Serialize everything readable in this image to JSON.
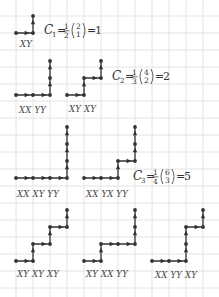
{
  "figure": {
    "grid": {
      "cell": 17,
      "origin_x": 16,
      "origin_y": 16,
      "color": "#e4e4e4"
    },
    "colors": {
      "path": "#333333",
      "text": "#444444",
      "background": "#ffffff"
    }
  },
  "rows": [
    {
      "formula": {
        "lhs": "C",
        "sub": "1",
        "frac_num": "1",
        "frac_den": "2",
        "binom_top": "2",
        "binom_bottom": "1",
        "result": "1",
        "x": 44,
        "y": 34
      },
      "paths": [
        {
          "label": "XY",
          "label_x": 20,
          "label_y": 47,
          "points": [
            [
              16,
              33
            ],
            [
              33,
              33
            ],
            [
              33,
              16
            ]
          ]
        }
      ]
    },
    {
      "formula": {
        "lhs": "C",
        "sub": "2",
        "frac_num": "1",
        "frac_den": "3",
        "binom_top": "4",
        "binom_bottom": "2",
        "result": "2",
        "x": 112,
        "y": 80
      },
      "paths": [
        {
          "label": "XX YY",
          "label_x": 19,
          "label_y": 113,
          "points": [
            [
              16,
              95
            ],
            [
              33,
              95
            ],
            [
              50,
              95
            ],
            [
              50,
              78
            ],
            [
              50,
              61
            ]
          ]
        },
        {
          "label": "XY XY",
          "label_x": 69,
          "label_y": 112,
          "points": [
            [
              67,
              95
            ],
            [
              84,
              95
            ],
            [
              84,
              78
            ],
            [
              101,
              78
            ],
            [
              101,
              61
            ]
          ]
        }
      ]
    },
    {
      "formula": {
        "lhs": "C",
        "sub": "3",
        "frac_num": "1",
        "frac_den": "4",
        "binom_top": "6",
        "binom_bottom": "3",
        "result": "5",
        "x": 133,
        "y": 180
      },
      "paths": [
        {
          "label": "XX XY YY",
          "label_x": 17,
          "label_y": 197,
          "points": [
            [
              16,
              178
            ],
            [
              33,
              178
            ],
            [
              50,
              178
            ],
            [
              67,
              178
            ],
            [
              67,
              161
            ],
            [
              67,
              144
            ],
            [
              67,
              127
            ]
          ]
        },
        {
          "label": "XX YX YY",
          "label_x": 86,
          "label_y": 197,
          "points": [
            [
              84,
              178
            ],
            [
              101,
              178
            ],
            [
              118,
              178
            ],
            [
              118,
              161
            ],
            [
              135,
              161
            ],
            [
              135,
              144
            ],
            [
              135,
              127
            ]
          ]
        }
      ]
    },
    {
      "formula": null,
      "paths": [
        {
          "label": "XY XY XY",
          "label_x": 17,
          "label_y": 277,
          "points": [
            [
              16,
              261
            ],
            [
              33,
              261
            ],
            [
              33,
              244
            ],
            [
              50,
              244
            ],
            [
              50,
              227
            ],
            [
              67,
              227
            ],
            [
              67,
              210
            ]
          ]
        },
        {
          "label": "XY XX YY",
          "label_x": 86,
          "label_y": 277,
          "points": [
            [
              84,
              261
            ],
            [
              101,
              261
            ],
            [
              101,
              244
            ],
            [
              118,
              244
            ],
            [
              135,
              244
            ],
            [
              135,
              227
            ],
            [
              135,
              210
            ]
          ]
        },
        {
          "label": "XX YY XY",
          "label_x": 155,
          "label_y": 278,
          "points": [
            [
              152,
              261
            ],
            [
              169,
              261
            ],
            [
              186,
              261
            ],
            [
              186,
              244
            ],
            [
              186,
              227
            ],
            [
              203,
              227
            ],
            [
              203,
              210
            ]
          ]
        }
      ]
    }
  ]
}
